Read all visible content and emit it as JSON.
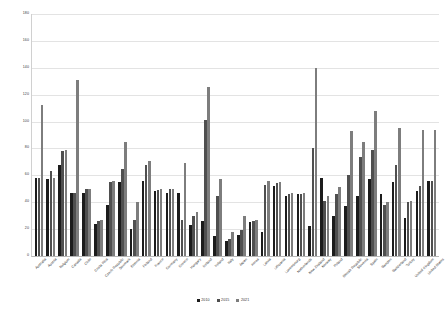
{
  "chart_data": {
    "type": "bar",
    "title": "",
    "subtitle": "",
    "xlabel": "",
    "ylabel": "",
    "ylim": [
      0,
      180
    ],
    "ytick_step": 20,
    "yticks": [
      0,
      20,
      40,
      60,
      80,
      100,
      120,
      140,
      160,
      180
    ],
    "grid": true,
    "legend_position": "bottom-center",
    "orientation": "vertical",
    "grouping": "grouped",
    "categories": [
      "Australia",
      "Austria",
      "Belgium",
      "Canada",
      "Chile",
      "Costa Rica",
      "Czech Republic",
      "Denmark",
      "Estonia",
      "Finland",
      "France",
      "Germany",
      "Greece",
      "Hungary",
      "Iceland",
      "Ireland",
      "Italy",
      "Japan",
      "Korea",
      "Latvia",
      "Lithuania",
      "Luxembourg",
      "Netherlands",
      "New Zealand",
      "Norway",
      "Poland",
      "Slovak Republic",
      "Slovenia",
      "Spain",
      "Sweden",
      "Switzerland",
      "Turkey",
      "United Kingdom",
      "United States"
    ],
    "series": [
      {
        "name": "2010",
        "color": "#1c1c1c",
        "values": [
          58,
          57,
          68,
          47,
          47,
          24,
          38,
          55,
          20,
          56,
          48,
          47,
          47,
          23,
          26,
          15,
          11,
          16,
          25,
          18,
          52,
          45,
          46,
          22,
          58,
          30,
          37,
          45,
          57,
          46,
          55,
          28,
          48,
          56
        ]
      },
      {
        "name": "2015",
        "color": "#4f4f4f",
        "values": [
          58,
          63,
          78,
          47,
          50,
          26,
          55,
          65,
          27,
          68,
          49,
          50,
          27,
          30,
          101,
          45,
          13,
          19,
          26,
          53,
          54,
          46,
          46,
          80,
          41,
          46,
          60,
          74,
          79,
          38,
          68,
          40,
          52,
          56
        ]
      },
      {
        "name": "2021",
        "color": "#7d7d7d",
        "values": [
          112,
          58,
          79,
          131,
          50,
          27,
          56,
          85,
          40,
          71,
          50,
          50,
          69,
          33,
          126,
          57,
          18,
          30,
          27,
          56,
          55,
          47,
          47,
          140,
          45,
          51,
          93,
          85,
          108,
          40,
          95,
          41,
          94,
          94
        ]
      }
    ],
    "peaks": {
      "max_value": 161,
      "max_category": "Iceland",
      "max_series": "2021"
    }
  },
  "legend": {
    "entries": [
      {
        "label": "2010",
        "color": "#1c1c1c"
      },
      {
        "label": "2015",
        "color": "#4f4f4f"
      },
      {
        "label": "2021",
        "color": "#7d7d7d"
      }
    ]
  }
}
